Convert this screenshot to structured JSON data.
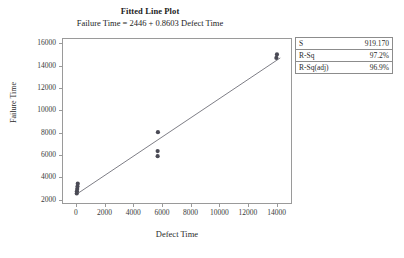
{
  "chart_data": {
    "type": "scatter",
    "title": "Fitted Line Plot",
    "subtitle": "Failure Time = 2446 + 0.8603 Defect Time",
    "xlabel": "Defect Time",
    "ylabel": "Failure Time",
    "xlim": [
      -900,
      15000
    ],
    "ylim": [
      1700,
      16400
    ],
    "xticks": [
      0,
      2000,
      4000,
      6000,
      8000,
      10000,
      12000,
      14000
    ],
    "yticks": [
      2000,
      4000,
      6000,
      8000,
      10000,
      12000,
      14000,
      16000
    ],
    "xtick_labels": [
      "0",
      "2000",
      "4000",
      "6000",
      "8000",
      "10000",
      "12000",
      "14000"
    ],
    "ytick_labels": [
      "2000",
      "4000",
      "6000",
      "8000",
      "10000",
      "12000",
      "14000",
      "16000"
    ],
    "grid": false,
    "legend": "none",
    "marker_color": "#4a4a55",
    "line_color": "#6f6f78",
    "frame_color": "#9a9a9a",
    "points": [
      {
        "x": 60,
        "y": 2550
      },
      {
        "x": 70,
        "y": 2750
      },
      {
        "x": 90,
        "y": 2950
      },
      {
        "x": 110,
        "y": 3180
      },
      {
        "x": 130,
        "y": 3430
      },
      {
        "x": 5700,
        "y": 5900
      },
      {
        "x": 5700,
        "y": 6350
      },
      {
        "x": 5720,
        "y": 8050
      },
      {
        "x": 13980,
        "y": 14700
      },
      {
        "x": 14020,
        "y": 15020
      }
    ],
    "fit": {
      "intercept": 2446,
      "slope": 0.8603,
      "x_start": 0,
      "x_end": 14250
    },
    "stats": {
      "rows": [
        {
          "key": "S",
          "value": "919.170"
        },
        {
          "key": "R-Sq",
          "value": "97.2%"
        },
        {
          "key": "R-Sq(adj)",
          "value": "96.9%"
        }
      ]
    }
  }
}
